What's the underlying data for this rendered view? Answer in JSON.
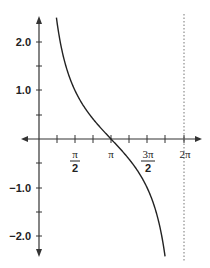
{
  "chart_data": {
    "type": "line",
    "title": "",
    "function": "y = cot(x/2)",
    "xlabel": "",
    "ylabel": "",
    "xlim": [
      -0.75,
      2.35
    ],
    "ylim": [
      -2.5,
      2.5
    ],
    "grid": false,
    "x_ticks": [
      {
        "value": 0.785,
        "label": ""
      },
      {
        "value": 1.571,
        "label": "π/2",
        "num": "π",
        "den": "2"
      },
      {
        "value": 2.356,
        "label": ""
      },
      {
        "value": 3.142,
        "label": "π"
      },
      {
        "value": 3.927,
        "label": ""
      },
      {
        "value": 4.712,
        "label": "3π/2",
        "num": "3π",
        "den": "2"
      },
      {
        "value": 5.498,
        "label": ""
      },
      {
        "value": 6.283,
        "label": "2π"
      }
    ],
    "y_ticks": [
      {
        "value": 2.0,
        "label": "2.0"
      },
      {
        "value": 1.5,
        "label": ""
      },
      {
        "value": 1.0,
        "label": "1.0"
      },
      {
        "value": 0.5,
        "label": ""
      },
      {
        "value": -0.5,
        "label": ""
      },
      {
        "value": -1.0,
        "label": "−1.0"
      },
      {
        "value": -1.5,
        "label": ""
      },
      {
        "value": -2.0,
        "label": "−2.0"
      }
    ],
    "series": [
      {
        "name": "cot(x/2)",
        "x": [
          0.76,
          1.0,
          1.2,
          1.571,
          2.0,
          2.5,
          3.142,
          3.8,
          4.3,
          4.712,
          5.1,
          5.5,
          5.8,
          6.0,
          6.1,
          6.2,
          6.283
        ],
        "values": [
          2.52,
          1.83,
          1.46,
          1.0,
          0.64,
          0.33,
          0.0,
          -0.34,
          -0.61,
          -1.0,
          -1.42,
          -2.03,
          -2.48,
          null,
          null,
          null,
          null
        ]
      }
    ],
    "asymptotes": [
      {
        "x": 6.283,
        "style": "dotted"
      }
    ]
  },
  "labels": {
    "y_2": "2.0",
    "y_1": "1.0",
    "y_m1": "−1.0",
    "y_m2": "−2.0",
    "x_pi_half_num": "π",
    "x_pi_half_den": "2",
    "x_pi": "π",
    "x_3pi_half_num": "3π",
    "x_3pi_half_den": "2",
    "x_2pi": "2π"
  }
}
